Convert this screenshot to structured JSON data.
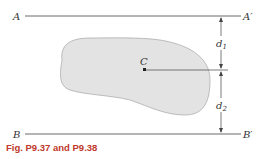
{
  "figure": {
    "caption": "Fig. P9.37 and P9.38",
    "labels": {
      "A": "A",
      "A_prime": "A′",
      "B": "B",
      "B_prime": "B′",
      "C": "C",
      "d1": "d",
      "d1_sub": "1",
      "d2": "d",
      "d2_sub": "2"
    },
    "colors": {
      "shape_fill": "#e3e3e3",
      "line": "#333333",
      "caption": "#c0392b"
    }
  }
}
